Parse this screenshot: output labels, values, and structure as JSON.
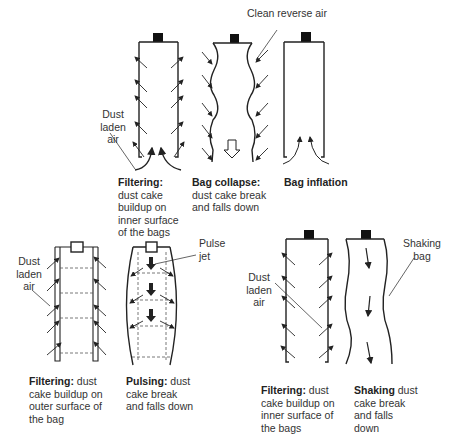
{
  "panels": {
    "reverse_air": {
      "filtering": {
        "caption_bold": "Filtering:",
        "caption_rest": " dust cake buildup on inner surface of the bags",
        "label": "Dust laden air"
      },
      "collapse": {
        "caption_bold": "Bag collapse:",
        "caption_rest": " dust cake break and falls down",
        "label": "Clean reverse air"
      },
      "inflation": {
        "caption_bold": "Bag inflation",
        "caption_rest": ""
      }
    },
    "pulse_jet": {
      "filtering": {
        "caption_bold": "Filtering:",
        "caption_rest": " dust cake buildup on outer surface of the bag",
        "label": "Dust laden air"
      },
      "pulsing": {
        "caption_bold": "Pulsing:",
        "caption_rest": " dust cake break and falls down",
        "label": "Pulse jet"
      }
    },
    "shaker": {
      "filtering": {
        "caption_bold": "Filtering:",
        "caption_rest": " dust cake buildup on inner surface of the bags",
        "label": "Dust laden air"
      },
      "shaking": {
        "caption_bold": "Shaking",
        "caption_rest": " dust cake break and falls down",
        "label": "Shaking bag"
      }
    }
  },
  "colors": {
    "line": "#222222",
    "dashed": "#555555",
    "text": "#333333"
  }
}
